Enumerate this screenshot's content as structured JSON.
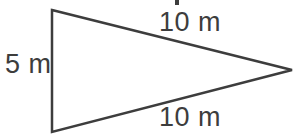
{
  "figure": {
    "type": "geometry-diagram",
    "shape": "triangle",
    "background_color": "#ffffff",
    "stroke_color": "#3d3d3d",
    "text_color": "#3d3d3d",
    "stroke_width": 2.5
  },
  "triangle": {
    "vertices": {
      "top_left": {
        "x": 52,
        "y": 10
      },
      "bottom_left": {
        "x": 52,
        "y": 132
      },
      "right_apex": {
        "x": 292,
        "y": 70
      }
    },
    "points_attr": "52,10 292,70 52,132"
  },
  "labels": {
    "left_side": "5 m",
    "top_side": "10 m",
    "bottom_side": "10 m"
  },
  "artifact": {
    "name": "clipped-descender-mark",
    "note": "partial ink from text cropped above the figure"
  }
}
